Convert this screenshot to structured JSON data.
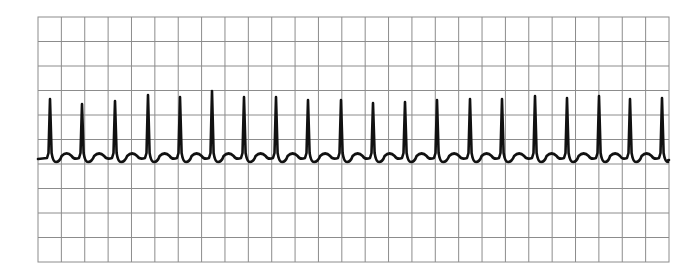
{
  "chart_data": {
    "type": "line",
    "title": "",
    "xlabel": "",
    "ylabel": "",
    "grid": {
      "on": true,
      "columns": 27,
      "rows": 10,
      "left": 38,
      "top": 17,
      "right": 669,
      "bottom": 262,
      "line_color": "#8c8c8c",
      "background": "#ffffff"
    },
    "trace": {
      "color": "#111111",
      "baseline_y": 159,
      "start_x": 38,
      "end_x": 669,
      "beat_count": 20,
      "r_peaks": [
        {
          "x": 50,
          "y": 99
        },
        {
          "x": 82,
          "y": 104
        },
        {
          "x": 115,
          "y": 101
        },
        {
          "x": 148,
          "y": 95
        },
        {
          "x": 180,
          "y": 97
        },
        {
          "x": 212,
          "y": 91
        },
        {
          "x": 244,
          "y": 97
        },
        {
          "x": 276,
          "y": 97
        },
        {
          "x": 308,
          "y": 100
        },
        {
          "x": 341,
          "y": 100
        },
        {
          "x": 373,
          "y": 103
        },
        {
          "x": 405,
          "y": 102
        },
        {
          "x": 437,
          "y": 100
        },
        {
          "x": 470,
          "y": 99
        },
        {
          "x": 502,
          "y": 99
        },
        {
          "x": 535,
          "y": 96
        },
        {
          "x": 567,
          "y": 98
        },
        {
          "x": 599,
          "y": 96
        },
        {
          "x": 630,
          "y": 99
        },
        {
          "x": 662,
          "y": 98
        }
      ]
    }
  }
}
